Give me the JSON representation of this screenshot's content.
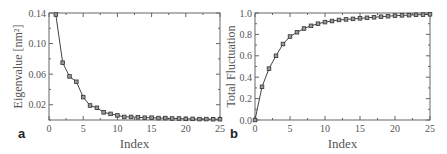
{
  "chart_data": [
    {
      "panel": "a",
      "type": "line",
      "title": "",
      "xlabel": "Index",
      "ylabel": "Eigenvalue [nm²]",
      "xlim": [
        0,
        25
      ],
      "ylim": [
        0,
        0.14
      ],
      "xticks": [
        0,
        5,
        10,
        15,
        20,
        25
      ],
      "yticks": [
        0.02,
        0.06,
        0.1,
        0.14
      ],
      "ytick_labels": [
        "0.02",
        "0.06",
        "0.10",
        "0.14"
      ],
      "grid": false,
      "marker": "square",
      "x": [
        1,
        2,
        3,
        4,
        5,
        6,
        7,
        8,
        9,
        10,
        11,
        12,
        13,
        14,
        15,
        16,
        17,
        18,
        19,
        20,
        21,
        22,
        23,
        24,
        25
      ],
      "values": [
        0.138,
        0.075,
        0.057,
        0.05,
        0.03,
        0.019,
        0.016,
        0.01,
        0.008,
        0.006,
        0.004,
        0.004,
        0.0035,
        0.003,
        0.003,
        0.0025,
        0.0025,
        0.002,
        0.002,
        0.0015,
        0.0015,
        0.0012,
        0.0012,
        0.001,
        0.001
      ]
    },
    {
      "panel": "b",
      "type": "line",
      "title": "",
      "xlabel": "Index",
      "ylabel": "Total Fluctuation",
      "xlim": [
        0,
        25
      ],
      "ylim": [
        0,
        1.0
      ],
      "xticks": [
        0,
        5,
        10,
        15,
        20,
        25
      ],
      "yticks": [
        0.0,
        0.2,
        0.4,
        0.6,
        0.8,
        1.0
      ],
      "ytick_labels": [
        "0.0",
        "0.2",
        "0.4",
        "0.6",
        "0.8",
        "1.0"
      ],
      "grid": false,
      "marker": "square",
      "x": [
        0,
        1,
        2,
        3,
        4,
        5,
        6,
        7,
        8,
        9,
        10,
        11,
        12,
        13,
        14,
        15,
        16,
        17,
        18,
        19,
        20,
        21,
        22,
        23,
        24,
        25
      ],
      "values": [
        0.0,
        0.31,
        0.48,
        0.6,
        0.71,
        0.78,
        0.82,
        0.855,
        0.88,
        0.9,
        0.915,
        0.925,
        0.935,
        0.94,
        0.945,
        0.95,
        0.955,
        0.96,
        0.965,
        0.97,
        0.975,
        0.978,
        0.98,
        0.983,
        0.985,
        0.988
      ]
    }
  ],
  "labels": {
    "panel_a": "a",
    "panel_b": "b"
  }
}
